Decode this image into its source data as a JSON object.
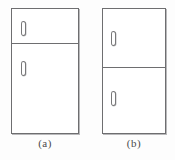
{
  "figure": {
    "line_color": "#6e6e70",
    "fill_color": "#ffffff",
    "background_color": "#fdfdfd",
    "caption_color": "#4a4a4c",
    "panels": [
      {
        "key": "a",
        "caption": "(a)",
        "description": "Refrigerator with small top freezer door and large lower fresh-food door",
        "doors": [
          {
            "name": "freezer-door",
            "position": "upper",
            "handle": "vertical-bar-handle"
          },
          {
            "name": "fridge-door",
            "position": "lower",
            "handle": "vertical-bar-handle"
          }
        ]
      },
      {
        "key": "b",
        "caption": "(b)",
        "description": "Refrigerator with two nearly equal stacked doors split near the middle",
        "doors": [
          {
            "name": "freezer-door",
            "position": "upper",
            "handle": "vertical-bar-handle"
          },
          {
            "name": "fridge-door",
            "position": "lower",
            "handle": "vertical-bar-handle"
          }
        ]
      }
    ]
  }
}
